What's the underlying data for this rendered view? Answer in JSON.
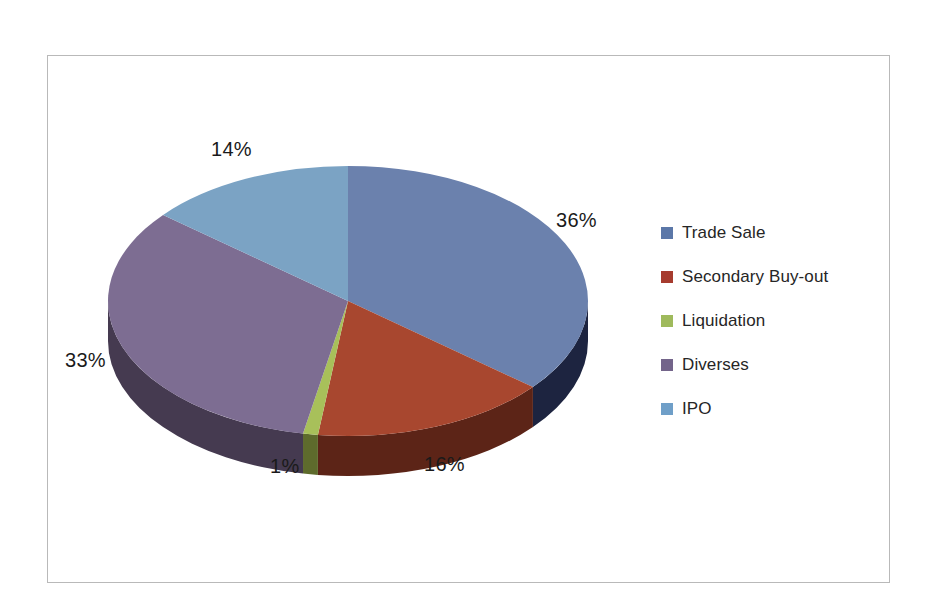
{
  "chart_data": {
    "type": "pie",
    "title": "",
    "subtitle": "",
    "xlabel": "",
    "ylabel": "",
    "grid": false,
    "legend_position": "right",
    "three_d": true,
    "start_angle_deg": 0,
    "direction": "clockwise",
    "categories": [
      "Trade Sale",
      "Secondary Buy-out",
      "Liquidation",
      "Diverses",
      "IPO"
    ],
    "values": [
      36,
      16,
      1,
      33,
      14
    ],
    "value_unit": "percent",
    "data_labels": [
      "36%",
      "16%",
      "1%",
      "33%",
      "14%"
    ],
    "colors": [
      "#6b81ad",
      "#a8472f",
      "#a8c05a",
      "#7d6d92",
      "#7ba3c4"
    ],
    "side_colors": [
      "#1d2440",
      "#5c2417",
      "#5e6b2c",
      "#453a50",
      "#3f5f7c"
    ]
  },
  "frame": {
    "border_color": "#b9b9b9",
    "background": "#ffffff"
  },
  "labels": {
    "trade_sale_pct": "36%",
    "secondary_buyout_pct": "16%",
    "liquidation_pct": "1%",
    "diverses_pct": "33%",
    "ipo_pct": "14%"
  },
  "legend": {
    "items": [
      {
        "label": "Trade Sale",
        "color": "#5b77a8"
      },
      {
        "label": "Secondary Buy-out",
        "color": "#a63b2e"
      },
      {
        "label": "Liquidation",
        "color": "#9fba5c"
      },
      {
        "label": "Diverses",
        "color": "#73648a"
      },
      {
        "label": "IPO",
        "color": "#6f9fc8"
      }
    ]
  }
}
